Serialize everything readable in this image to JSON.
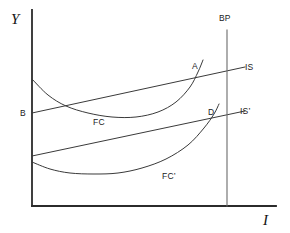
{
  "figure": {
    "background_color": "#ffffff",
    "line_color": "#3a3a3a",
    "axis_color": "#2b2b2b",
    "width": 290,
    "height": 233
  },
  "axes": {
    "y_label": "Y",
    "x_label": "I",
    "origin_x": 32,
    "origin_y": 206,
    "x_axis_end": 276,
    "y_axis_top": 10
  },
  "labels": {
    "bp": "BP",
    "is": "IS",
    "is_prime": "IS’",
    "fc": "FC",
    "fc_prime": "FC’",
    "point_a": "A",
    "point_b": "B",
    "point_d": "D"
  },
  "chart_data": {
    "type": "line",
    "title": "",
    "xlabel": "I",
    "ylabel": "Y",
    "grid": false,
    "legend": "inline-curve-labels",
    "xlim": [
      32,
      276
    ],
    "ylim": [
      206,
      10
    ],
    "note": "Axis values are unlabeled; coordinates are in pixel space of the original figure (y inverted, larger y = lower on screen).",
    "series": [
      {
        "name": "IS",
        "kind": "line",
        "label": "IS",
        "label_pos": [
          245,
          68
        ],
        "points": [
          [
            32,
            113
          ],
          [
            245,
            67
          ]
        ]
      },
      {
        "name": "IS’",
        "kind": "line",
        "label": "IS’",
        "label_pos": [
          241,
          113
        ],
        "points": [
          [
            32,
            156
          ],
          [
            245,
            111
          ]
        ]
      },
      {
        "name": "FC",
        "kind": "curve",
        "label": "FC",
        "label_pos": [
          94,
          122
        ],
        "points": [
          [
            32,
            79
          ],
          [
            48,
            95
          ],
          [
            66,
            106
          ],
          [
            88,
            113
          ],
          [
            112,
            117
          ],
          [
            136,
            117
          ],
          [
            158,
            112
          ],
          [
            176,
            102
          ],
          [
            190,
            87
          ],
          [
            198,
            72
          ],
          [
            203,
            60
          ]
        ]
      },
      {
        "name": "FC’",
        "kind": "curve",
        "label": "FC’",
        "label_pos": [
          163,
          177
        ],
        "points": [
          [
            32,
            162
          ],
          [
            50,
            169
          ],
          [
            70,
            173
          ],
          [
            94,
            174
          ],
          [
            118,
            173
          ],
          [
            142,
            168
          ],
          [
            166,
            159
          ],
          [
            188,
            145
          ],
          [
            204,
            128
          ],
          [
            214,
            114
          ],
          [
            219,
            104
          ]
        ]
      },
      {
        "name": "BP",
        "kind": "vertical-line",
        "label": "BP",
        "label_pos": [
          220,
          18
        ],
        "points": [
          [
            227,
            30
          ],
          [
            227,
            206
          ]
        ]
      }
    ],
    "annotations": [
      {
        "text": "A",
        "x": 195,
        "y": 67,
        "marker_at": [
          198,
          73
        ],
        "desc": "intersection of IS and FC"
      },
      {
        "text": "B",
        "x": 21,
        "y": 113,
        "marker_at": [
          32,
          113
        ],
        "desc": "IS intercept on Y axis"
      },
      {
        "text": "D",
        "x": 209,
        "y": 112,
        "marker_at": [
          214,
          116
        ],
        "desc": "intersection of IS’ and FC’"
      }
    ]
  }
}
